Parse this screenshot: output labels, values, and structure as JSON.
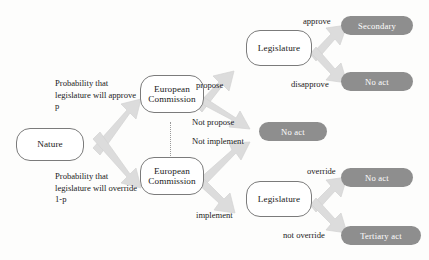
{
  "diagram": {
    "colors": {
      "node_border": "#7b7b7b",
      "node_fill": "#ffffff",
      "terminal_fill": "#8e8e8e",
      "terminal_text": "#ffffff",
      "arrow_fill": "#dcdcdc",
      "arrow_edge": "#cfcfcf",
      "text": "#1b1b1b",
      "infoset_line": "#9a9a9a"
    },
    "nodes": [
      {
        "id": "nature",
        "label": "Nature"
      },
      {
        "id": "ec_top",
        "label": "European\nCommission"
      },
      {
        "id": "ec_bottom",
        "label": "European\nCommission"
      },
      {
        "id": "legislature_top",
        "label": "Legislature"
      },
      {
        "id": "legislature_bottom",
        "label": "Legislature"
      }
    ],
    "node_labels": {
      "nature": "Nature",
      "ec_top_line1": "European",
      "ec_top_line2": "Commission",
      "ec_bottom_line1": "European",
      "ec_bottom_line2": "Commission",
      "legislature_top": "Legislature",
      "legislature_bottom": "Legislature"
    },
    "terminals": [
      {
        "id": "secondary",
        "label": "Secondary"
      },
      {
        "id": "no_act_top",
        "label": "No act"
      },
      {
        "id": "no_act_middle",
        "label": "No act"
      },
      {
        "id": "no_act_bottom",
        "label": "No act"
      },
      {
        "id": "tertiary_act",
        "label": "Tertiary act"
      }
    ],
    "terminal_labels": {
      "secondary": "Secondary",
      "no_act_top": "No act",
      "no_act_middle": "No act",
      "no_act_bottom": "No act",
      "tertiary_act": "Tertiary act"
    },
    "edge_labels": {
      "prob_approve": "Probability that legislature will approve p",
      "prob_override": "Probability that legislature will override 1-p",
      "propose": "propose",
      "not_propose": "Not propose",
      "not_implement": "Not implement",
      "implement": "implement",
      "approve": "approve",
      "disapprove": "disapprove",
      "override": "override",
      "not_override": "not override"
    }
  }
}
